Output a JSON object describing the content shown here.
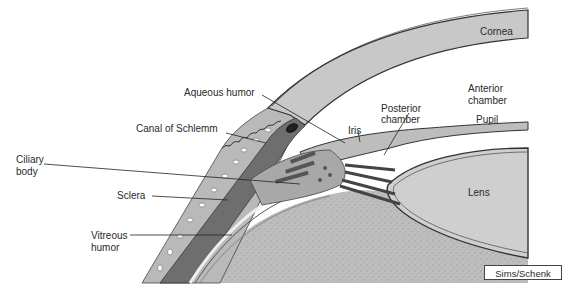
{
  "diagram": {
    "labels": {
      "cornea": "Cornea",
      "aqueous_humor": "Aqueous humor",
      "canal_of_schlemm": "Canal of Schlemm",
      "iris": "Iris",
      "posterior_chamber_1": "Posterior",
      "posterior_chamber_2": "chamber",
      "anterior_chamber_1": "Anterior",
      "anterior_chamber_2": "chamber",
      "pupil": "Pupil",
      "ciliary_body_1": "Ciliary",
      "ciliary_body_2": "body",
      "sclera": "Sclera",
      "vitreous_humor_1": "Vitreous",
      "vitreous_humor_2": "humor",
      "lens": "Lens"
    },
    "credit": "Sims/Schenk",
    "colors": {
      "cornea_fill": "#c8c8c8",
      "sclera_dark": "#6e6e6e",
      "conjunctiva": "#b4b4b4",
      "lens_fill": "#cfcfcf",
      "vitreous_fill": "#bdbdbd",
      "outline": "#333333",
      "background": "#ffffff"
    }
  }
}
